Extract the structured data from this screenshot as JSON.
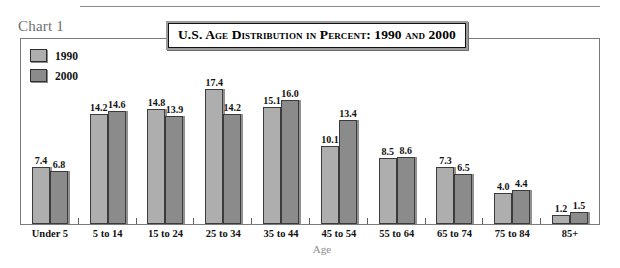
{
  "caption": "Chart 1",
  "title": "U.S. Age Distribution in Percent: 1990 and 2000",
  "legend": [
    {
      "label": "1990",
      "color": "#aeaeae"
    },
    {
      "label": "2000",
      "color": "#8b8b8b"
    }
  ],
  "axis_title": "Age",
  "colors": {
    "series_1990": "#aeaeae",
    "series_2000": "#8b8b8b",
    "bar_border": "#3b3b3b",
    "frame": "#7b7b7b",
    "caption_text": "#6c6f72",
    "axis_title_text": "#8b8e90",
    "title_plate": "#9c9c9c"
  },
  "chart_data": {
    "type": "bar",
    "title": "U.S. Age Distribution in Percent: 1990 and 2000",
    "xlabel": "Age",
    "ylabel": "",
    "ylim": [
      0,
      17.4
    ],
    "grid": false,
    "legend_position": "top-left",
    "categories": [
      "Under 5",
      "5 to 14",
      "15 to 24",
      "25 to 34",
      "35 to 44",
      "45 to 54",
      "55 to 64",
      "65 to 74",
      "75 to 84",
      "85+"
    ],
    "series": [
      {
        "name": "1990",
        "values": [
          7.4,
          14.2,
          14.8,
          17.4,
          15.1,
          10.1,
          8.5,
          7.3,
          4.0,
          1.2
        ]
      },
      {
        "name": "2000",
        "values": [
          6.8,
          14.6,
          13.9,
          14.2,
          16.0,
          13.4,
          8.6,
          6.5,
          4.4,
          1.5
        ]
      }
    ],
    "labels": {
      "1990": [
        "7.4",
        "14.2",
        "14.8",
        "17.4",
        "15.1",
        "10.1",
        "8.5",
        "7.3",
        "4.0",
        "1.2"
      ],
      "2000": [
        "6.8",
        "14.6",
        "13.9",
        "14.2",
        "16.0",
        "13.4",
        "8.6",
        "6.5",
        "4.4",
        "1.5"
      ]
    }
  }
}
